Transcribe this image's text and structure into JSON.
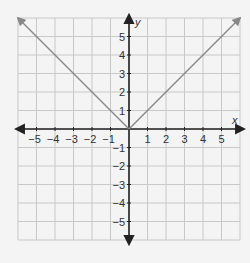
{
  "chart_data": {
    "type": "line",
    "title": "",
    "xlabel": "x",
    "ylabel": "y",
    "xlim": [
      -6,
      6
    ],
    "ylim": [
      -6,
      6
    ],
    "grid": true,
    "x_ticks": [
      -5,
      -4,
      -3,
      -2,
      -1,
      1,
      2,
      3,
      4,
      5
    ],
    "y_ticks": [
      -5,
      -4,
      -3,
      -2,
      -1,
      1,
      2,
      3,
      4,
      5
    ],
    "series": [
      {
        "name": "y = |x|",
        "x": [
          -6,
          0,
          6
        ],
        "y": [
          6,
          0,
          6
        ],
        "arrows": "both-ends",
        "color": "#888888"
      }
    ]
  },
  "colors": {
    "grid": "#c8c8c8",
    "axes": "#222222",
    "curve": "#888888",
    "background": "#f4f4f4"
  }
}
